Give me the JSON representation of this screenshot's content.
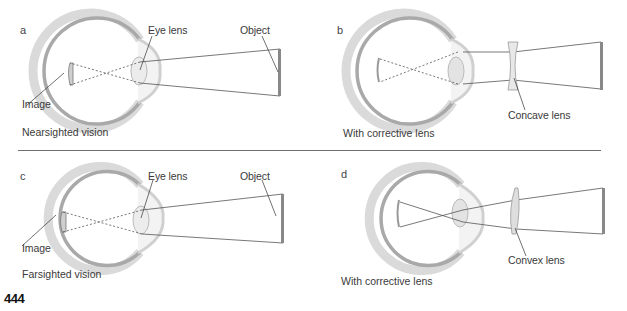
{
  "panels": [
    {
      "letter": "a",
      "caption": "Nearsighted vision",
      "labels": {
        "eye_lens": "Eye lens",
        "object": "Object",
        "image": "Image"
      }
    },
    {
      "letter": "b",
      "caption": "With corrective lens",
      "labels": {
        "lens": "Concave lens"
      }
    },
    {
      "letter": "c",
      "caption": "Farsighted vision",
      "labels": {
        "eye_lens": "Eye lens",
        "object": "Object",
        "image": "Image"
      }
    },
    {
      "letter": "d",
      "caption": "With corrective lens",
      "labels": {
        "lens": "Convex lens"
      }
    }
  ],
  "page_number": "444",
  "colors": {
    "eye_outer": "#d9d9d9",
    "eye_inner": "#a8a8a8",
    "ray": "#555555",
    "lens_fill": "#e6e6e6",
    "divider": "#6f6f6f"
  }
}
